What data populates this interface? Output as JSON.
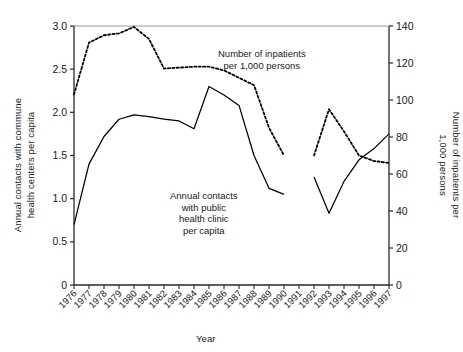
{
  "chart_data": {
    "type": "line",
    "title": "",
    "xlabel": "Year",
    "ylabel_left": "Annual contacts with commune health centers per capita",
    "ylabel_right": "Number of inpatients per 1,000 persons",
    "categories": [
      "1976",
      "1977",
      "1978",
      "1979",
      "1980",
      "1981",
      "1982",
      "1983",
      "1984",
      "1985",
      "1986",
      "1987",
      "1988",
      "1989",
      "1990",
      "1991",
      "1992",
      "1993",
      "1994",
      "1995",
      "1996",
      "1997"
    ],
    "ylim_left": [
      0,
      3.0
    ],
    "ylim_right": [
      0,
      140
    ],
    "yticks_left": [
      "0",
      "0.5",
      "1.0",
      "1.5",
      "2.0",
      "2.5",
      "3.0"
    ],
    "ytick_values_left": [
      0,
      0.5,
      1.0,
      1.5,
      2.0,
      2.5,
      3.0
    ],
    "yticks_right": [
      "0",
      "20",
      "40",
      "60",
      "80",
      "100",
      "120",
      "140"
    ],
    "ytick_values_right": [
      0,
      20,
      40,
      60,
      80,
      100,
      120,
      140
    ],
    "grid": false,
    "legend_position": "inline-annotations",
    "series": [
      {
        "name": "Annual contacts with public health clinic per capita",
        "axis": "left",
        "style": "solid",
        "color": "#000000",
        "annotation": "Annual contacts\nwith public\nhealth clinic\nper capita",
        "x": [
          "1976",
          "1977",
          "1978",
          "1979",
          "1980",
          "1981",
          "1982",
          "1983",
          "1984",
          "1985",
          "1986",
          "1987",
          "1988",
          "1989",
          "1990"
        ],
        "values": [
          0.7,
          1.4,
          1.72,
          1.92,
          1.97,
          1.95,
          1.92,
          1.9,
          1.81,
          2.3,
          2.2,
          2.08,
          1.5,
          1.12,
          1.05
        ],
        "x2": [
          "1992",
          "1993",
          "1994",
          "1995",
          "1996",
          "1997"
        ],
        "values2": [
          1.25,
          0.83,
          1.2,
          1.45,
          1.58,
          1.75
        ]
      },
      {
        "name": "Number of inpatients per 1,000 persons",
        "axis": "right",
        "style": "dotted",
        "color": "#000000",
        "annotation": "Number of inpatients\nper 1,000 persons",
        "x": [
          "1976",
          "1977",
          "1978",
          "1979",
          "1980",
          "1981",
          "1982",
          "1983",
          "1984",
          "1985",
          "1986",
          "1987",
          "1988",
          "1989",
          "1990"
        ],
        "values": [
          103.0,
          131.0,
          135.0,
          136.0,
          139.5,
          133.0,
          117.0,
          117.5,
          118.0,
          118.0,
          116.0,
          112.0,
          108.0,
          85.0,
          70.0
        ],
        "x2": [
          "1992",
          "1993",
          "1994",
          "1995",
          "1996",
          "1997"
        ],
        "values2": [
          70.0,
          95.0,
          83.0,
          70.0,
          67.0,
          66.0
        ]
      }
    ],
    "annotations": [
      {
        "name": "inpatients-label",
        "text_lines": [
          "Number of inpatients",
          "per 1,000 persons"
        ]
      },
      {
        "name": "clinic-label",
        "text_lines": [
          "Annual contacts",
          "with public",
          "health clinic",
          "per capita"
        ]
      }
    ]
  },
  "labels": {
    "xlabel": "Year",
    "ylabel_left_line1": "Annual contacts with commune",
    "ylabel_left_line2": "health centers per capita",
    "ylabel_right_line1": "Number of inpatients per",
    "ylabel_right_line2": "1,000 persons"
  }
}
